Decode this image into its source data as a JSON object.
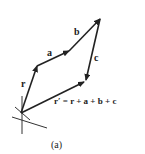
{
  "diagram": {
    "type": "vector-addition",
    "colors": {
      "stroke": "#222222",
      "background": "#ffffff"
    },
    "origin": [
      21,
      113
    ],
    "vectors": [
      {
        "name": "r",
        "from": [
          21,
          113
        ],
        "to": [
          37,
          66
        ]
      },
      {
        "name": "a",
        "from": [
          37,
          66
        ],
        "to": [
          69,
          51
        ]
      },
      {
        "name": "b",
        "from": [
          69,
          51
        ],
        "to": [
          100,
          19
        ]
      },
      {
        "name": "c",
        "from": [
          100,
          19
        ],
        "to": [
          85,
          81
        ]
      },
      {
        "name": "r'",
        "from": [
          21,
          113
        ],
        "to": [
          85,
          81
        ]
      }
    ],
    "labels": {
      "r": "r",
      "a": "a",
      "b": "b",
      "c": "c",
      "equation": "r′ = r + a + b + c"
    },
    "caption": "(a)"
  }
}
